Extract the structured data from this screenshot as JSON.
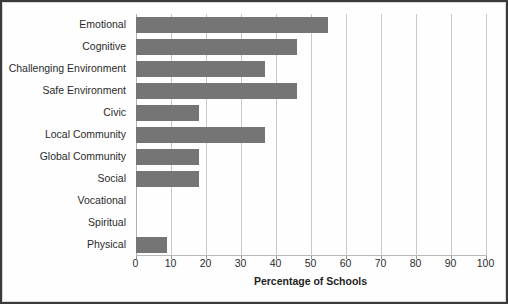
{
  "chart_data": {
    "type": "bar",
    "orientation": "horizontal",
    "title": "",
    "xlabel": "Percentage of Schools",
    "ylabel": "",
    "xlim": [
      0,
      100
    ],
    "xticks": [
      0,
      10,
      20,
      30,
      40,
      50,
      60,
      70,
      80,
      90,
      100
    ],
    "xtick_labels": [
      "0",
      "10",
      "20",
      "30",
      "40",
      "50",
      "60",
      "70",
      "80",
      "90",
      "100"
    ],
    "grid": "vertical",
    "legend": "none",
    "bar_color": "#757575",
    "categories": [
      "Emotional",
      "Cognitive",
      "Challenging Environment",
      "Safe Environment",
      "Civic",
      "Local Community",
      "Global Community",
      "Social",
      "Vocational",
      "Spiritual",
      "Physical"
    ],
    "values": [
      55,
      46,
      37,
      46,
      18,
      37,
      18,
      18,
      0,
      0,
      9
    ]
  }
}
